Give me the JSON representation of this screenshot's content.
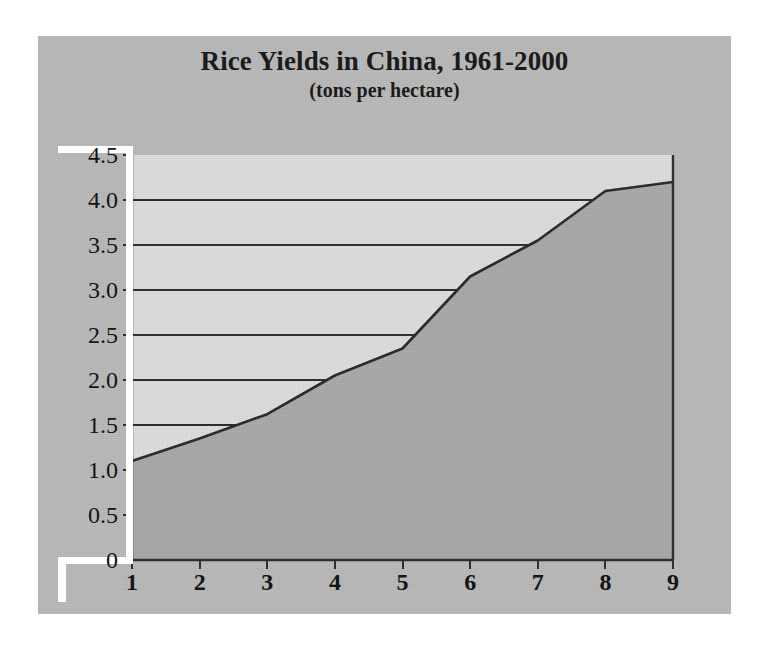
{
  "chart_data": {
    "type": "area",
    "title": "Rice Yields in China, 1961-2000",
    "subtitle": "(tons per hectare)",
    "xlabel": "",
    "ylabel": "",
    "x": [
      1,
      2,
      3,
      4,
      5,
      6,
      7,
      8,
      9
    ],
    "values": [
      1.1,
      1.35,
      1.62,
      2.05,
      2.35,
      3.15,
      3.55,
      4.1,
      4.2
    ],
    "series": [
      {
        "name": "Rice yield",
        "values": [
          1.1,
          1.35,
          1.62,
          2.05,
          2.35,
          3.15,
          3.55,
          4.1,
          4.2
        ]
      }
    ],
    "xlim": [
      1,
      9
    ],
    "ylim": [
      0,
      4.5
    ],
    "xticks": [
      "1",
      "2",
      "3",
      "4",
      "5",
      "6",
      "7",
      "8",
      "9"
    ],
    "yticks": [
      "4.5",
      "4.0",
      "3.5",
      "3.0",
      "2.5",
      "2.0",
      "1.5",
      "1.0",
      "0.5",
      "0"
    ],
    "ytick_values": [
      4.5,
      4.0,
      3.5,
      3.0,
      2.5,
      2.0,
      1.5,
      1.0,
      0.5,
      0
    ],
    "gridlines": {
      "enabled": true,
      "orientation": "horizontal",
      "values": [
        1.5,
        2.0,
        2.5,
        3.0,
        3.5,
        4.0
      ],
      "note": "drawn from the y-axis only until they meet the filled area"
    },
    "legend": null,
    "colors": {
      "plate_background": "#b9b9b9",
      "plot_background": "#dedede",
      "area_fill": "#a8a8a8",
      "line": "#262626",
      "gridline": "#2a2a2a",
      "axis": "#2a2a2a",
      "text": "#141414",
      "page_background": "#ffffff"
    }
  }
}
